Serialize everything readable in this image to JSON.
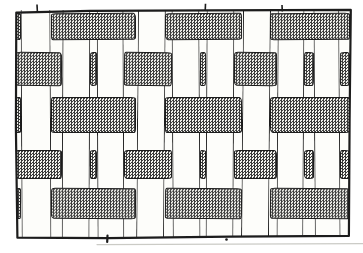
{
  "figure": {
    "kind": "hand-drawn plain-weave (basket weave) textile illustration",
    "text_content": "none"
  },
  "colors": {
    "ink": "#1c1c1c",
    "paper": "#fdfdfa",
    "paper_outer": "#ffffff",
    "shade_dark": "#383838",
    "shade_bg": "#f6f6f1",
    "artifact_gray": "#cbcbc6"
  },
  "frame": {
    "inner_x": 16,
    "inner_y": 10,
    "inner_width": 334,
    "inner_height": 227,
    "stroke_width": 2.2,
    "outline_path": "M16.3,12.6 L90,10.9 L210,10.3 L350.8,9.9 L349.6,120 L348.9,235.9 L230,236.6 L108,238.1 L17.4,237.7 L15.9,128 Z"
  },
  "weave": {
    "strips": [
      {
        "x": 21,
        "w": 30,
        "rot": -0.25
      },
      {
        "x": 62,
        "w": 28,
        "rot": 0.2
      },
      {
        "x": 97,
        "w": 27,
        "rot": -0.2
      },
      {
        "x": 137,
        "w": 28,
        "rot": 0.45
      },
      {
        "x": 172,
        "w": 28,
        "rot": -0.3
      },
      {
        "x": 206,
        "w": 28,
        "rot": 0.25
      },
      {
        "x": 242,
        "w": 28,
        "rot": 0.5
      },
      {
        "x": 277,
        "w": 27,
        "rot": 0.3
      },
      {
        "x": 314,
        "w": 26,
        "rot": -0.35
      }
    ],
    "rows": [
      {
        "y": 13,
        "h": 27,
        "rot": -0.3,
        "type": "odd"
      },
      {
        "y": 52,
        "h": 34,
        "rot": 0.45,
        "type": "even"
      },
      {
        "y": 97,
        "h": 36,
        "rot": -0.12,
        "type": "odd"
      },
      {
        "y": 150,
        "h": 29,
        "rot": 0.1,
        "type": "even"
      },
      {
        "y": 188,
        "h": 31,
        "rot": 0.5,
        "type": "odd"
      }
    ],
    "odd_segments": [
      [
        16,
        21
      ],
      [
        51,
        136
      ],
      [
        165,
        242
      ],
      [
        270,
        350
      ]
    ],
    "even_segments": [
      [
        16,
        62
      ],
      [
        90,
        97
      ],
      [
        124,
        172
      ],
      [
        200,
        206
      ],
      [
        234,
        277
      ],
      [
        304,
        314
      ],
      [
        340,
        350
      ]
    ]
  },
  "artifacts": {
    "overshoot_ticks_top": [
      {
        "x1": 37,
        "y1": 4.5,
        "x2": 37.4,
        "y2": 12
      },
      {
        "x1": 205.5,
        "y1": 3.8,
        "x2": 205.2,
        "y2": 11
      },
      {
        "x1": 282,
        "y1": 5,
        "x2": 282.3,
        "y2": 11.5
      }
    ],
    "overshoot_tick_bottom": {
      "x1": 107.5,
      "y1": 235.5,
      "x2": 107.2,
      "y2": 242
    },
    "speck": {
      "cx": 226.5,
      "cy": 239.5,
      "r": 1.3
    },
    "faint_scan_line": {
      "x1": 97,
      "y1": 244.6,
      "x2": 363,
      "y2": 243.6
    }
  }
}
